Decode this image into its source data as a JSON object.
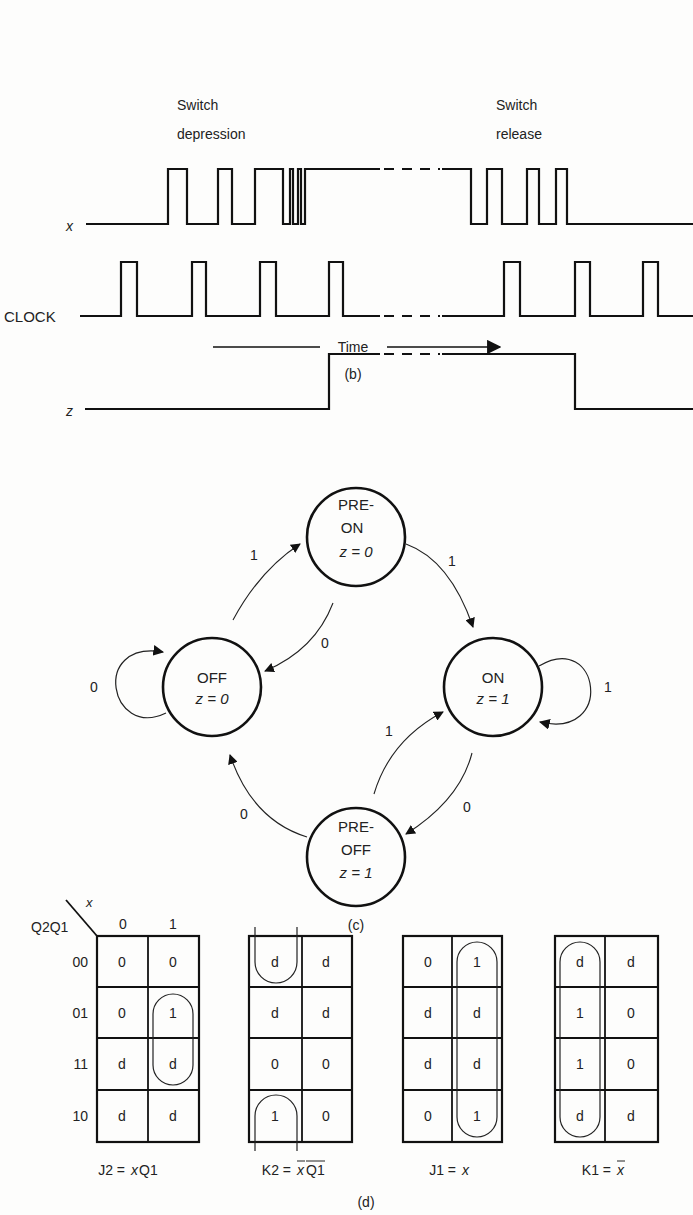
{
  "timing": {
    "caption": "(b)",
    "annotations": {
      "press_line1": "Switch",
      "press_line2": "depression",
      "release_line1": "Switch",
      "release_line2": "release"
    },
    "signals": [
      {
        "name": "x",
        "label": "x",
        "italic": true
      },
      {
        "name": "clock",
        "label": "CLOCK",
        "italic": false
      },
      {
        "name": "z",
        "label": "z",
        "italic": true
      }
    ],
    "time_axis_label": "Time"
  },
  "state_diagram": {
    "caption": "(c)",
    "states": [
      {
        "id": "off",
        "line1": "OFF",
        "line2": "",
        "output": "z = 0"
      },
      {
        "id": "pre_on",
        "line1": "PRE-",
        "line2": "ON",
        "output": "z = 0"
      },
      {
        "id": "on",
        "line1": "ON",
        "line2": "",
        "output": "z = 1"
      },
      {
        "id": "pre_off",
        "line1": "PRE-",
        "line2": "OFF",
        "output": "z = 1"
      }
    ],
    "transitions": [
      {
        "from": "off",
        "to": "off",
        "input": "0"
      },
      {
        "from": "off",
        "to": "pre_on",
        "input": "1"
      },
      {
        "from": "pre_on",
        "to": "off",
        "input": "0"
      },
      {
        "from": "pre_on",
        "to": "on",
        "input": "1"
      },
      {
        "from": "on",
        "to": "on",
        "input": "1"
      },
      {
        "from": "on",
        "to": "pre_off",
        "input": "0"
      },
      {
        "from": "pre_off",
        "to": "on",
        "input": "1"
      },
      {
        "from": "pre_off",
        "to": "off",
        "input": "0"
      }
    ]
  },
  "kmaps": {
    "caption": "(d)",
    "row_var": "Q2Q1",
    "col_var": "x",
    "col_headers": [
      "0",
      "1"
    ],
    "row_headers": [
      "00",
      "01",
      "11",
      "10"
    ],
    "maps": [
      {
        "name": "J2",
        "eq_lhs": "J2 =",
        "eq_rhs": "xQ1",
        "cells": [
          [
            "0",
            "0"
          ],
          [
            "0",
            "1"
          ],
          [
            "d",
            "d"
          ],
          [
            "d",
            "d"
          ]
        ]
      },
      {
        "name": "K2",
        "eq_lhs": "K2 =",
        "eq_rhs": "x̄Q̅1̅",
        "cells": [
          [
            "d",
            "d"
          ],
          [
            "d",
            "d"
          ],
          [
            "0",
            "0"
          ],
          [
            "1",
            "0"
          ]
        ]
      },
      {
        "name": "J1",
        "eq_lhs": "J1 =",
        "eq_rhs": "x",
        "cells": [
          [
            "0",
            "1"
          ],
          [
            "d",
            "d"
          ],
          [
            "d",
            "d"
          ],
          [
            "0",
            "1"
          ]
        ]
      },
      {
        "name": "K1",
        "eq_lhs": "K1 =",
        "eq_rhs": "x̄",
        "cells": [
          [
            "d",
            "d"
          ],
          [
            "1",
            "0"
          ],
          [
            "1",
            "0"
          ],
          [
            "d",
            "d"
          ]
        ]
      }
    ]
  }
}
